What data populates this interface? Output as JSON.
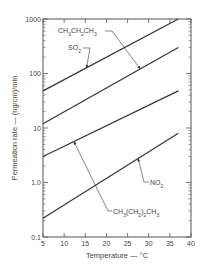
{
  "chart_data": {
    "type": "line",
    "title": "",
    "xlabel": "Temperature — °C",
    "ylabel": "Permeation rate — (ng/cm)/min",
    "xlim": [
      5,
      40
    ],
    "ylim": [
      0.1,
      1000
    ],
    "yscale": "log",
    "grid": false,
    "legend_position": "none (inline annotations with arrows)",
    "x_ticks": [
      "5",
      "10",
      "15",
      "20",
      "25",
      "30",
      "35",
      "40"
    ],
    "y_ticks": [
      "0.1",
      "1.0",
      "10",
      "100",
      "1000"
    ],
    "series": [
      {
        "name": "SO2",
        "label_text": "SO",
        "label_sub": "2",
        "x": [
          5,
          37
        ],
        "values": [
          48,
          1000
        ]
      },
      {
        "name": "CH3CH2CH3",
        "label_text": "CH3CH2CH3",
        "x": [
          5,
          37
        ],
        "values": [
          12,
          300
        ]
      },
      {
        "name": "CH3(CH2)2CH3",
        "label_text": "CH3(CH2)2CH3",
        "x": [
          5,
          37
        ],
        "values": [
          3,
          48
        ]
      },
      {
        "name": "NO2",
        "label_text": "NO",
        "label_sub": "2",
        "x": [
          5,
          37
        ],
        "values": [
          0.22,
          8
        ]
      }
    ],
    "annotations": [
      "CH3CH2CH3",
      "SO2",
      "CH3(CH2)2CH3",
      "NO2"
    ]
  }
}
